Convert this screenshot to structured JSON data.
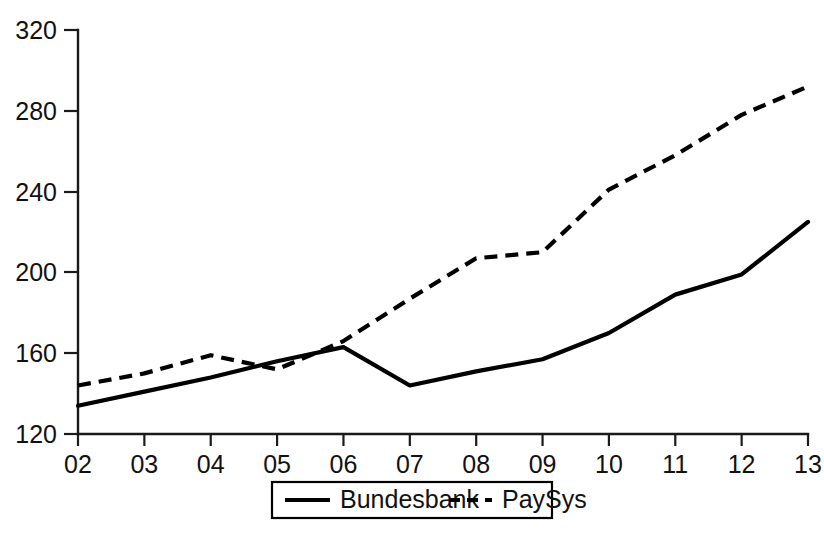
{
  "chart_data": {
    "type": "line",
    "title": "",
    "subtitle": "",
    "xlabel": "",
    "ylabel": "",
    "x": [
      "02",
      "03",
      "04",
      "05",
      "06",
      "07",
      "08",
      "09",
      "10",
      "11",
      "12",
      "13"
    ],
    "xtick_labels": [
      "02",
      "03",
      "04",
      "05",
      "06",
      "07",
      "08",
      "09",
      "10",
      "11",
      "12",
      "13"
    ],
    "ytick_labels": [
      "120",
      "160",
      "200",
      "240",
      "280",
      "320"
    ],
    "ytick_values": [
      120,
      160,
      200,
      240,
      280,
      320
    ],
    "ylim": [
      120,
      320
    ],
    "grid": false,
    "legend_position": "bottom-center",
    "series": [
      {
        "name": "Bundesbank",
        "style": "solid",
        "color": "#000000",
        "values": [
          134,
          141,
          148,
          156,
          163,
          144,
          151,
          157,
          170,
          189,
          199,
          225
        ]
      },
      {
        "name": "PaySys",
        "style": "dashed",
        "color": "#000000",
        "values": [
          144,
          150,
          159,
          152,
          166,
          187,
          207,
          210,
          241,
          258,
          278,
          292
        ]
      }
    ],
    "legend": [
      {
        "label": "Bundesbank",
        "style": "solid"
      },
      {
        "label": "PaySys",
        "style": "dashed"
      }
    ]
  }
}
